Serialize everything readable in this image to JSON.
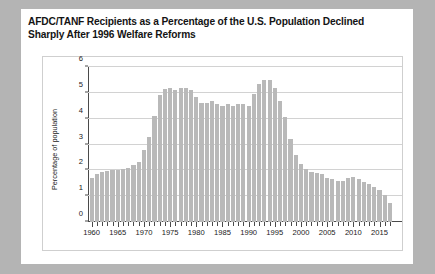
{
  "chart_data": {
    "type": "bar",
    "title": "AFDC/TANF Recipients as a Percentage of the U.S. Population Declined Sharply After 1996 Welfare Reforms",
    "xlabel": "",
    "ylabel": "Percentage of population",
    "ylim": [
      0,
      6
    ],
    "yticks": [
      0,
      1,
      2,
      3,
      4,
      5,
      6
    ],
    "grid": true,
    "legend": null,
    "bar_color": "#b9b9b9",
    "xtick_labels": [
      "1960",
      "1965",
      "1970",
      "1975",
      "1980",
      "1985",
      "1990",
      "1995",
      "2000",
      "2005",
      "2010",
      "2015"
    ],
    "categories": [
      "1960",
      "1961",
      "1962",
      "1963",
      "1964",
      "1965",
      "1966",
      "1967",
      "1968",
      "1969",
      "1970",
      "1971",
      "1972",
      "1973",
      "1974",
      "1975",
      "1976",
      "1977",
      "1978",
      "1979",
      "1980",
      "1981",
      "1982",
      "1983",
      "1984",
      "1985",
      "1986",
      "1987",
      "1988",
      "1989",
      "1990",
      "1991",
      "1992",
      "1993",
      "1994",
      "1995",
      "1996",
      "1997",
      "1998",
      "1999",
      "2000",
      "2001",
      "2002",
      "2003",
      "2004",
      "2005",
      "2006",
      "2007",
      "2008",
      "2009",
      "2010",
      "2011",
      "2012",
      "2013",
      "2014",
      "2015",
      "2016",
      "2017"
    ],
    "values": [
      1.72,
      1.86,
      1.92,
      1.96,
      2.0,
      2.0,
      2.05,
      2.1,
      2.22,
      2.32,
      2.8,
      3.3,
      4.1,
      4.9,
      5.15,
      5.2,
      5.1,
      5.2,
      5.2,
      5.1,
      4.85,
      4.6,
      4.6,
      4.7,
      4.55,
      4.5,
      4.55,
      4.5,
      4.55,
      4.55,
      4.5,
      4.95,
      5.35,
      5.5,
      5.5,
      5.2,
      4.7,
      4.05,
      3.2,
      2.6,
      2.25,
      2.05,
      1.95,
      1.9,
      1.85,
      1.72,
      1.66,
      1.6,
      1.6,
      1.7,
      1.74,
      1.67,
      1.55,
      1.48,
      1.34,
      1.23,
      1.05,
      0.72
    ]
  }
}
